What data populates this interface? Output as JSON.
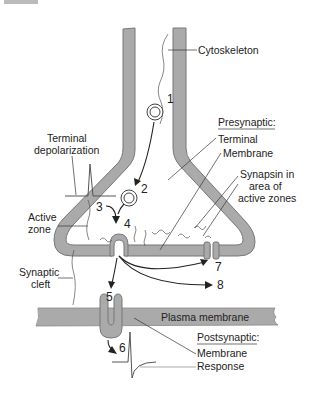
{
  "figure": {
    "corner_tab": "",
    "labels": {
      "cytoskeleton": "Cytoskeleton",
      "presynaptic_heading": "Presynaptic:",
      "terminal": "Terminal",
      "membrane": "Membrane",
      "synapsin_line1": "Synapsin in",
      "synapsin_line2": "area of",
      "synapsin_line3": "active zones",
      "terminal_depol_line1": "Terminal",
      "terminal_depol_line2": "depolarization",
      "active_zone_line1": "Active",
      "active_zone_line2": "zone",
      "synaptic_cleft_line1": "Synaptic",
      "synaptic_cleft_line2": "cleft",
      "plasma_membrane": "Plasma membrane",
      "postsynaptic_heading": "Postsynaptic:",
      "post_membrane": "Membrane",
      "post_response": "Response"
    },
    "steps": [
      "1",
      "2",
      "3",
      "4",
      "5",
      "6",
      "7",
      "8"
    ],
    "colors": {
      "membrane_fill": "#aaaaaa",
      "membrane_edge": "#777777",
      "ink": "#222222"
    }
  }
}
